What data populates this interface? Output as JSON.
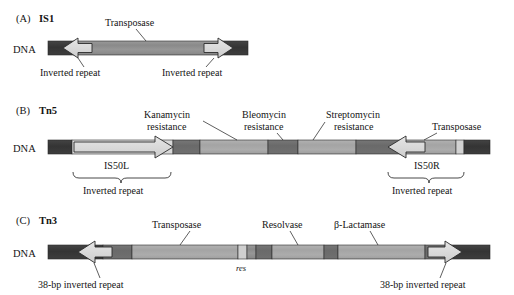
{
  "figure": {
    "kind": "transposon-structure-diagram",
    "background": "#ffffff",
    "colors": {
      "dna_flank": "#3a3a3a",
      "segment_dark": "#6e6e6e",
      "segment_medium": "#8e8e8e",
      "segment_light": "#a8a8a8",
      "res_site": "#cfcfcf",
      "arrow_fill": "#dcdcdc",
      "outline": "#2b2b2b",
      "text": "#141414"
    }
  },
  "panels": [
    {
      "id": "A",
      "tag": "(A)",
      "name": "IS1",
      "dna_label": "DNA",
      "annotations": [
        {
          "key": "transposase",
          "text": "Transposase"
        },
        {
          "key": "inverted_repeat_left",
          "text": "Inverted repeat"
        },
        {
          "key": "inverted_repeat_right",
          "text": "Inverted repeat"
        }
      ],
      "features": [
        {
          "key": "dna_left",
          "type": "flank",
          "shade": "dna_flank"
        },
        {
          "key": "ir_left_arrow",
          "type": "arrow",
          "direction": "left",
          "shade": "arrow_fill"
        },
        {
          "key": "transposase_body",
          "type": "segment",
          "shade": "segment_medium"
        },
        {
          "key": "ir_right_arrow",
          "type": "arrow",
          "direction": "right",
          "shade": "arrow_fill"
        },
        {
          "key": "dna_right",
          "type": "flank",
          "shade": "dna_flank"
        }
      ]
    },
    {
      "id": "B",
      "tag": "(B)",
      "name": "Tn5",
      "dna_label": "DNA",
      "annotations": [
        {
          "key": "kanamycin",
          "text": "Kanamycin\nresistance",
          "line1": "Kanamycin",
          "line2": "resistance"
        },
        {
          "key": "bleomycin",
          "text": "Bleomycin\nresistance",
          "line1": "Bleomycin",
          "line2": "resistance"
        },
        {
          "key": "streptomycin",
          "text": "Streptomycin\nresistance",
          "line1": "Streptomycin",
          "line2": "resistance"
        },
        {
          "key": "transposase",
          "text": "Transposase"
        }
      ],
      "element_labels": [
        {
          "key": "is50l",
          "text": "IS50L"
        },
        {
          "key": "is50r",
          "text": "IS50R"
        }
      ],
      "brace_labels": [
        {
          "key": "inverted_repeat_left",
          "text": "Inverted repeat"
        },
        {
          "key": "inverted_repeat_right",
          "text": "Inverted repeat"
        }
      ],
      "features": [
        {
          "key": "dna_left",
          "type": "flank",
          "shade": "dna_flank"
        },
        {
          "key": "is50l_arrow",
          "type": "arrow",
          "direction": "right",
          "shade": "arrow_fill"
        },
        {
          "key": "spacer_1",
          "type": "segment",
          "shade": "segment_dark"
        },
        {
          "key": "kanamycin_segment",
          "type": "segment",
          "shade": "segment_light"
        },
        {
          "key": "bleomycin_segment",
          "type": "segment",
          "shade": "segment_dark"
        },
        {
          "key": "streptomycin_segment",
          "type": "segment",
          "shade": "segment_light"
        },
        {
          "key": "spacer_2",
          "type": "segment",
          "shade": "segment_dark"
        },
        {
          "key": "is50r_arrow",
          "type": "arrow",
          "direction": "left",
          "shade": "arrow_fill"
        },
        {
          "key": "transposase_segment",
          "type": "segment",
          "shade": "segment_light"
        },
        {
          "key": "is50r_tail",
          "type": "segment",
          "shade": "res_site"
        },
        {
          "key": "dna_right",
          "type": "flank",
          "shade": "dna_flank"
        }
      ]
    },
    {
      "id": "C",
      "tag": "(C)",
      "name": "Tn3",
      "dna_label": "DNA",
      "annotations": [
        {
          "key": "transposase",
          "text": "Transposase"
        },
        {
          "key": "resolvase",
          "text": "Resolvase"
        },
        {
          "key": "beta_lactamase",
          "text": "β-Lactamase"
        }
      ],
      "site_labels": [
        {
          "key": "res",
          "text": "res",
          "style": "italic"
        }
      ],
      "brace_labels": [
        {
          "key": "inverted_repeat_left",
          "text": "38-bp inverted repeat"
        },
        {
          "key": "inverted_repeat_right",
          "text": "38-bp inverted repeat"
        }
      ],
      "features": [
        {
          "key": "dna_left",
          "type": "flank",
          "shade": "dna_flank"
        },
        {
          "key": "ir_left_arrow",
          "type": "arrow",
          "direction": "left",
          "shade": "arrow_fill"
        },
        {
          "key": "spacer_1",
          "type": "segment",
          "shade": "segment_dark"
        },
        {
          "key": "transposase_segment",
          "type": "segment",
          "shade": "segment_light"
        },
        {
          "key": "res_site",
          "type": "segment",
          "shade": "res_site"
        },
        {
          "key": "post_res",
          "type": "segment",
          "shade": "segment_medium"
        },
        {
          "key": "spacer_2",
          "type": "segment",
          "shade": "segment_dark"
        },
        {
          "key": "resolvase_segment",
          "type": "segment",
          "shade": "segment_light"
        },
        {
          "key": "spacer_3",
          "type": "segment",
          "shade": "segment_dark"
        },
        {
          "key": "beta_lactamase_segment",
          "type": "segment",
          "shade": "segment_light"
        },
        {
          "key": "spacer_4",
          "type": "segment",
          "shade": "segment_dark"
        },
        {
          "key": "ir_right_arrow",
          "type": "arrow",
          "direction": "right",
          "shade": "arrow_fill"
        },
        {
          "key": "dna_right",
          "type": "flank",
          "shade": "dna_flank"
        }
      ]
    }
  ]
}
